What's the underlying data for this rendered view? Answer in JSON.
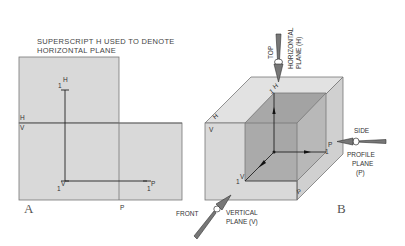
{
  "annotation": {
    "line1": "SUPERSCRIPT H USED TO DENOTE",
    "line2": "HORIZONTAL PLANE"
  },
  "panel_a": {
    "letter": "A",
    "fold_label_h": "H",
    "fold_label_v": "V",
    "fold_label_p": "P",
    "point_h": {
      "base": "1",
      "sup": "H"
    },
    "point_v": {
      "base": "1",
      "sup": "V"
    },
    "point_p": {
      "base": "1",
      "sup": "P"
    }
  },
  "panel_b": {
    "letter": "B",
    "face_label_h": "H",
    "face_label_v": "V",
    "face_label_p": "P",
    "point_h": {
      "base": "1",
      "sup": "H"
    },
    "point_v": {
      "base": "1",
      "sup": "V"
    },
    "point_p": {
      "base": "1",
      "sup": "P"
    },
    "views": {
      "top": {
        "label": "TOP",
        "plane_line1": "HORIZONTAL",
        "plane_line2": "PLANE (H)"
      },
      "side": {
        "label": "SIDE",
        "plane_line1": "PROFILE",
        "plane_line2": "PLANE",
        "plane_line3": "(P)"
      },
      "front": {
        "label": "FRONT",
        "plane_line1": "VERTICAL",
        "plane_line2": "PLANE (V)"
      }
    }
  },
  "colors": {
    "plane_fill": "#d9d9d9",
    "plane_top": "#e2e2e2",
    "plane_side": "#d0d0d0",
    "inner_dark": "#a9a9a9",
    "inner_mid": "#b8b8b8",
    "line": "#222222"
  }
}
